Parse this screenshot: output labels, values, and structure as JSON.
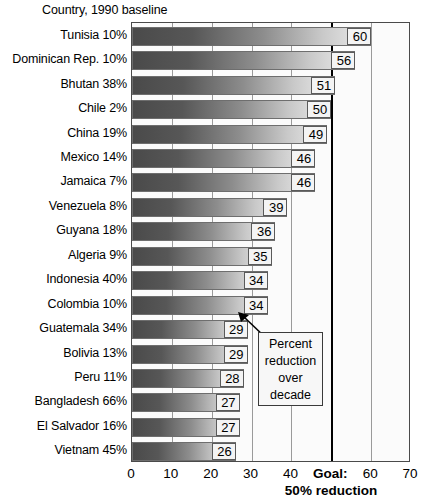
{
  "chart_data": {
    "type": "bar",
    "orientation": "horizontal",
    "title": "",
    "axis_caption": "Country, 1990 baseline",
    "xlabel": "",
    "ylabel": "",
    "xlim": [
      0,
      70
    ],
    "grid": true,
    "gridlines": [
      0,
      10,
      20,
      30,
      40,
      50,
      60,
      70
    ],
    "tick_labels": [
      "0",
      "10",
      "20",
      "30",
      "40",
      "Goal:",
      "60",
      "70"
    ],
    "goal": {
      "value": 50,
      "label": "Goal:",
      "sublabel": "50% reduction"
    },
    "annotation": {
      "text": "Percent reduction over decade",
      "lines": [
        "Percent",
        "reduction",
        "over",
        "decade"
      ],
      "points_to_category": "Colombia 10%"
    },
    "categories": [
      "Tunisia 10%",
      "Dominican Rep. 10%",
      "Bhutan 38%",
      "Chile 2%",
      "China 19%",
      "Mexico 14%",
      "Jamaica 7%",
      "Venezuela 8%",
      "Guyana 18%",
      "Algeria 9%",
      "Indonesia 40%",
      "Colombia 10%",
      "Guatemala 34%",
      "Bolivia 13%",
      "Peru 11%",
      "Bangladesh 66%",
      "El Salvador 16%",
      "Vietnam 45%"
    ],
    "values": [
      60,
      56,
      51,
      50,
      49,
      46,
      46,
      39,
      36,
      35,
      34,
      34,
      29,
      29,
      28,
      27,
      27,
      26
    ],
    "value_labels": [
      "60",
      "56",
      "51",
      "50",
      "49",
      "46",
      "46",
      "39",
      "36",
      "35",
      "34",
      "34",
      "29",
      "29",
      "28",
      "27",
      "27",
      "26"
    ],
    "colors": {
      "bar_gradient_start": "#4a4a4a",
      "bar_gradient_end": "#ededed",
      "bar_border": "#6e6e6e",
      "gridline": "#9a9a9a",
      "goal_line": "#000000",
      "frame": "#4a4a4a",
      "plot_background": "#fbfbfb",
      "value_box_background": "#f4f4f4",
      "text": "#000000"
    }
  }
}
